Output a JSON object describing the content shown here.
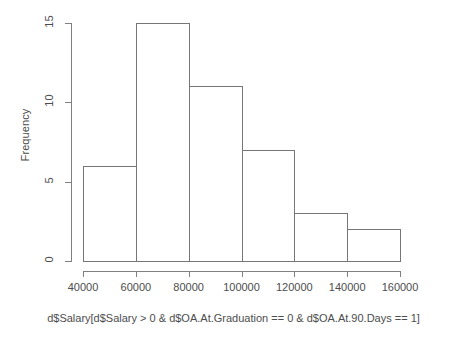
{
  "chart_data": {
    "type": "bar",
    "chart_kind": "histogram",
    "title": "",
    "subtitle": "",
    "xlabel": "d$Salary[d$Salary > 0 & d$OA.At.Graduation == 0 & d$OA.At.90.Days == 1]",
    "ylabel": "Frequency",
    "categories": [
      "40000-60000",
      "60000-80000",
      "80000-100000",
      "100000-120000",
      "120000-140000",
      "140000-160000"
    ],
    "bin_edges": [
      40000,
      60000,
      80000,
      100000,
      120000,
      140000,
      160000
    ],
    "bin_width": 20000,
    "values": [
      6,
      15,
      11,
      7,
      3,
      2
    ],
    "total_count": 44,
    "xlim": [
      40000,
      160000
    ],
    "ylim": [
      0,
      15
    ],
    "x_ticks": [
      40000,
      60000,
      80000,
      100000,
      120000,
      140000,
      160000
    ],
    "x_tick_labels": [
      "40000",
      "60000",
      "80000",
      "100000",
      "120000",
      "140000",
      "160000"
    ],
    "y_ticks": [
      0,
      5,
      10,
      15
    ],
    "y_tick_labels": [
      "0",
      "5",
      "10",
      "15"
    ],
    "grid": false,
    "legend": false,
    "legend_position": "none",
    "bar_fill": "#ffffff",
    "bar_stroke": "#767676",
    "axis_color": "#808080",
    "text_color": "#4d4d4d",
    "background": "#ffffff"
  }
}
